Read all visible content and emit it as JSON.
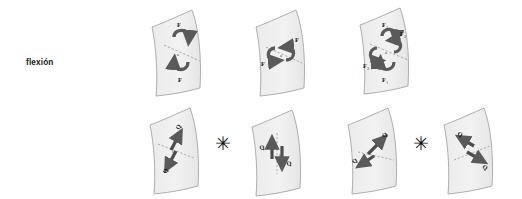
{
  "figure": {
    "background_color": "#ffffff",
    "shell_fill": "#f0f0f0",
    "shell_stroke": "#9a9a9a",
    "arrow_color": "#5a5a5a",
    "label_color": "#141414",
    "axis_style": "dashed"
  },
  "rows": [
    {
      "id": "flexion",
      "label": "flexión",
      "label_text": "flexión",
      "operator_symbols": [],
      "panels": [
        {
          "name": "bending-panel-1",
          "description": "curved shell with vertical pair of curved moment arrows",
          "arrow_pair": "vertical",
          "force_labels": [
            "F",
            "F"
          ],
          "force_label_positions": [
            "top",
            "bottom"
          ],
          "axis_label": "a",
          "axis_orientation": "diagonal"
        },
        {
          "name": "bending-panel-2",
          "description": "curved shell with horizontal pair of curved moment arrows",
          "arrow_pair": "horizontal",
          "force_labels": [
            "F",
            "F"
          ],
          "force_label_positions": [
            "left",
            "right"
          ],
          "axis_label": "a",
          "axis_orientation": "diagonal"
        },
        {
          "name": "bending-panel-3",
          "description": "curved shell with superposed vertical and horizontal curved moment arrows",
          "arrow_pair": "combined",
          "force_labels": [
            "F",
            "F",
            "F",
            "F"
          ],
          "force_label_subscripts": [
            "1",
            "2",
            "1",
            "2"
          ],
          "force_label_positions": [
            "top",
            "right",
            "left",
            "bottom"
          ],
          "axis_label": "a",
          "axis_orientation": "diagonal"
        }
      ]
    },
    {
      "id": "esfuerzo-cortante-perpendicular",
      "label": "esfuerzo cortante\nperpendicular",
      "label_text": "esfuerzo cortante perpendicular",
      "operator_symbols": [
        "✳",
        "✳"
      ],
      "panels": [
        {
          "name": "shear-panel-1",
          "description": "curved shell with diagonal pair of opposed straight shear arrows",
          "arrow_pair": "diagonal-steep",
          "force_labels": [
            "Q",
            "Q"
          ],
          "force_label_positions": [
            "upper-right",
            "lower-left"
          ],
          "axis_label": "a",
          "axis_orientation": "diagonal"
        },
        {
          "name": "shear-panel-2",
          "description": "curved shell with vertical pair of opposed straight shear arrows",
          "arrow_pair": "vertical",
          "force_labels": [
            "Q",
            "Q"
          ],
          "force_label_positions": [
            "left",
            "right"
          ],
          "axis_label": "a",
          "axis_orientation": "vertical"
        },
        {
          "name": "shear-panel-3",
          "description": "curved shell with diagonal pair of opposed straight shear arrows",
          "arrow_pair": "diagonal-shallow",
          "force_labels": [
            "Q",
            "Q"
          ],
          "force_label_positions": [
            "left",
            "upper-right"
          ],
          "axis_label": "a",
          "axis_orientation": "diagonal"
        },
        {
          "name": "shear-panel-4",
          "description": "curved shell with diagonal pair of opposed straight shear arrows",
          "arrow_pair": "diagonal-mirror",
          "force_labels": [
            "Q",
            "Q"
          ],
          "force_label_positions": [
            "upper-left",
            "lower-right"
          ],
          "axis_label": "a",
          "axis_orientation": "diagonal"
        }
      ]
    }
  ]
}
